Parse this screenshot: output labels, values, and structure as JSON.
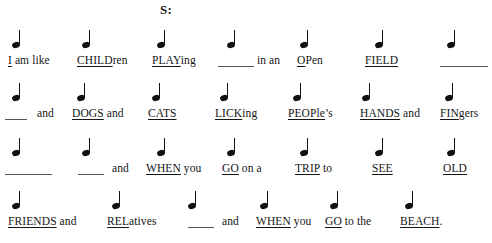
{
  "title": "S:",
  "document": {
    "kind": "rhythm-lyric-worksheet",
    "note_glyph": "quarter-note",
    "ink_color": "#111111",
    "blank_color": "#555555"
  },
  "lines": [
    {
      "id": "line-1",
      "notes": [
        12,
        82,
        157,
        227,
        300,
        375,
        447
      ],
      "cells": [
        {
          "x": 8,
          "stressed": "I",
          "plain": " am like"
        },
        {
          "x": 77,
          "stressed": "CHILD",
          "plain": "ren"
        },
        {
          "x": 152,
          "stressed": "PLAY",
          "plain": "ing"
        },
        {
          "x": 257,
          "stressed": "",
          "plain": "in an"
        },
        {
          "x": 297,
          "stressed": "O",
          "plain": "Pen"
        },
        {
          "x": 365,
          "stressed": "FIELD",
          "plain": ""
        }
      ],
      "blanks": [
        {
          "x": 218,
          "w": 36
        },
        {
          "x": 440,
          "w": 48
        }
      ]
    },
    {
      "id": "line-2",
      "notes": [
        12,
        77,
        152,
        220,
        293,
        362,
        445
      ],
      "cells": [
        {
          "x": 37,
          "stressed": "",
          "plain": "and"
        },
        {
          "x": 72,
          "stressed": "DOGS",
          "plain": " and"
        },
        {
          "x": 148,
          "stressed": "CATS",
          "plain": ""
        },
        {
          "x": 215,
          "stressed": "LICK",
          "plain": "ing"
        },
        {
          "x": 288,
          "stressed": "PEOPle",
          "plain": "’s"
        },
        {
          "x": 360,
          "stressed": "HANDS",
          "plain": " and"
        },
        {
          "x": 440,
          "stressed": "FIN",
          "plain": "gers"
        }
      ],
      "blanks": [
        {
          "x": 5,
          "w": 22
        }
      ]
    },
    {
      "id": "line-3",
      "notes": [
        12,
        82,
        157,
        227,
        300,
        375,
        447
      ],
      "cells": [
        {
          "x": 112,
          "stressed": "",
          "plain": "and"
        },
        {
          "x": 146,
          "stressed": "WHEN",
          "plain": " you"
        },
        {
          "x": 222,
          "stressed": "GO",
          "plain": " on a"
        },
        {
          "x": 295,
          "stressed": "TRIP",
          "plain": " to"
        },
        {
          "x": 372,
          "stressed": "SEE",
          "plain": ""
        },
        {
          "x": 443,
          "stressed": "OLD",
          "plain": ""
        }
      ],
      "blanks": [
        {
          "x": 5,
          "w": 47
        },
        {
          "x": 78,
          "w": 26
        }
      ]
    },
    {
      "id": "line-4",
      "notes": [
        12,
        112,
        188,
        260,
        330,
        405
      ],
      "cells": [
        {
          "x": 8,
          "stressed": "FRIENDS",
          "plain": " and"
        },
        {
          "x": 107,
          "stressed": "REL",
          "plain": "atives"
        },
        {
          "x": 222,
          "stressed": "",
          "plain": "and"
        },
        {
          "x": 256,
          "stressed": "WHEN",
          "plain": " you"
        },
        {
          "x": 325,
          "stressed": "GO",
          "plain": " to the"
        },
        {
          "x": 400,
          "stressed": "BEACH",
          "plain": "."
        }
      ],
      "blanks": [
        {
          "x": 188,
          "w": 26
        }
      ]
    }
  ]
}
